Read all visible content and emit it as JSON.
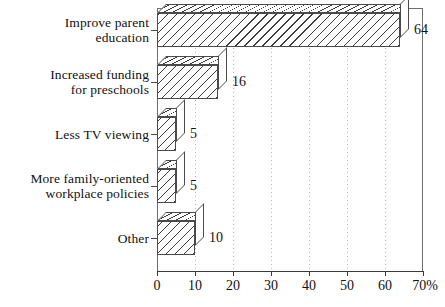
{
  "chart_data": {
    "type": "bar",
    "orientation": "horizontal",
    "title": "",
    "subtitle": "",
    "xlabel": "",
    "ylabel": "",
    "categories": [
      "Improve parent\neducation",
      "Increased funding\nfor preschools",
      "Less TV viewing",
      "More family-oriented\nworkplace policies",
      "Other"
    ],
    "values": [
      64,
      16,
      5,
      5,
      10
    ],
    "value_labels": [
      "64",
      "16",
      "5",
      "5",
      "10"
    ],
    "xlim": [
      0,
      70
    ],
    "xticks": [
      0,
      10,
      20,
      30,
      40,
      50,
      60,
      70
    ],
    "xtick_labels": [
      "0",
      "10",
      "20",
      "30",
      "40",
      "50",
      "60",
      "70%"
    ],
    "unit": "%",
    "grid": "vertical-dotted",
    "legend": "none",
    "style": "3d-hatched-bars",
    "colors": {
      "bar_fill": "#ffffff",
      "bar_hatch": "#3d3d3d",
      "bar_outline": "#4a4a4a",
      "axis": "#3b3b3b",
      "frame": "#6e6e6e",
      "gridline": "#b9b9b9",
      "text": "#111111",
      "background": "#ffffff"
    }
  }
}
